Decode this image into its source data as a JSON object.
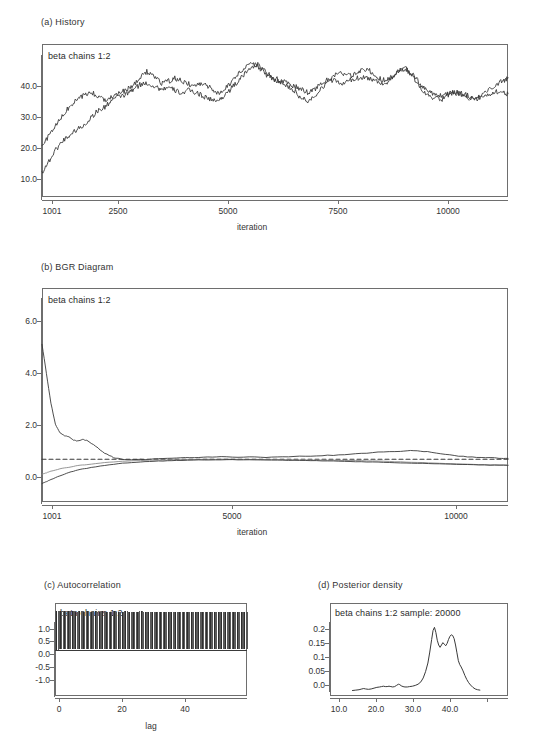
{
  "figure": {
    "background": "#ffffff",
    "line_color": "#3a3a3a",
    "frame_color": "#6e6e6e"
  },
  "panels": {
    "history": {
      "title": "(a)  History",
      "legend": "beta chains 1:2",
      "xlabel": "iteration",
      "yticks": [
        "10.0",
        "20.0",
        "30.0",
        "40.0"
      ],
      "xticks": [
        "1001",
        "2500",
        "5000",
        "7500",
        "10000"
      ]
    },
    "bgr": {
      "title": "(b)  BGR Diagram",
      "legend": "beta chains 1:2",
      "xlabel": "iteration",
      "yticks": [
        "0.0",
        "2.0",
        "4.0",
        "6.0"
      ],
      "xticks": [
        "1001",
        "5000",
        "10000"
      ]
    },
    "autocorrelation": {
      "title": "(c)  Autocorrelation",
      "legend": "beta chains 1:2",
      "xlabel": "lag",
      "yticks": [
        "-1.0",
        "-0.5",
        "0.0",
        "0.5",
        "1.0"
      ],
      "xticks": [
        "0",
        "20",
        "40"
      ]
    },
    "density": {
      "title": "(d)  Posterior density",
      "legend": "beta chains 1:2 sample: 20000",
      "xlabel": "",
      "yticks": [
        "0.0",
        "0.05",
        "0.1",
        "0.15",
        "0.2"
      ],
      "xticks": [
        "10.0",
        "20.0",
        "30.0",
        "40.0"
      ]
    }
  },
  "chart_data": [
    {
      "type": "line",
      "id": "history",
      "title": "(a)  History",
      "subtitle": "beta chains 1:2",
      "xlabel": "iteration",
      "ylabel": "",
      "xlim": [
        1001,
        11000
      ],
      "ylim": [
        8.0,
        44.0
      ],
      "xticks": [
        1001,
        2500,
        5000,
        7500,
        10000
      ],
      "yticks": [
        10.0,
        20.0,
        30.0,
        40.0
      ],
      "grid": false,
      "legend_position": "top-left-inside",
      "series": [
        {
          "name": "chain 1",
          "color": "#3a3a3a",
          "x": [
            1001,
            1150,
            1300,
            1450,
            1600,
            1750,
            1900,
            2050,
            2200,
            2350,
            2500,
            2650,
            2800,
            2950,
            3100,
            3250,
            3400,
            3550,
            3700,
            3850,
            4000,
            4150,
            4300,
            4450,
            4600,
            4750,
            4900,
            5050,
            5200,
            5350,
            5500,
            5650,
            5800,
            5950,
            6100,
            6250,
            6400,
            6550,
            6700,
            6850,
            7000,
            7150,
            7300,
            7450,
            7600,
            7750,
            7900,
            8050,
            8200,
            8350,
            8500,
            8650,
            8800,
            8950,
            9100,
            9250,
            9400,
            9550,
            9700,
            9850,
            10000,
            10150,
            10300,
            10450,
            10600,
            10750,
            10900,
            11000
          ],
          "y": [
            19.8,
            22.5,
            24.8,
            27.2,
            29.4,
            30.8,
            31.9,
            32.7,
            31.6,
            30.9,
            31.8,
            32.4,
            33.1,
            34.2,
            35.9,
            37.6,
            36.4,
            34.8,
            35.2,
            35.9,
            35.3,
            34.6,
            34.1,
            34.8,
            33.9,
            32.1,
            33.4,
            34.9,
            36.8,
            38.4,
            39.7,
            38.6,
            36.9,
            35.8,
            35.1,
            34.4,
            33.2,
            31.4,
            30.6,
            31.9,
            33.7,
            35.4,
            36.8,
            37.2,
            36.4,
            36.9,
            38.2,
            37.6,
            36.1,
            35.4,
            36.2,
            37.8,
            38.3,
            36.4,
            34.2,
            32.1,
            31.3,
            30.8,
            31.9,
            32.6,
            32.1,
            31.4,
            30.9,
            31.8,
            33.4,
            34.6,
            35.4,
            36.1
          ]
        },
        {
          "name": "chain 2",
          "color": "#3a3a3a",
          "x": [
            1001,
            1150,
            1300,
            1450,
            1600,
            1750,
            1900,
            2050,
            2200,
            2350,
            2500,
            2650,
            2800,
            2950,
            3100,
            3250,
            3400,
            3550,
            3700,
            3850,
            4000,
            4150,
            4300,
            4450,
            4600,
            4750,
            4900,
            5050,
            5200,
            5350,
            5500,
            5650,
            5800,
            5950,
            6100,
            6250,
            6400,
            6550,
            6700,
            6850,
            7000,
            7150,
            7300,
            7450,
            7600,
            7750,
            7900,
            8050,
            8200,
            8350,
            8500,
            8650,
            8800,
            8950,
            9100,
            9250,
            9400,
            9550,
            9700,
            9850,
            10000,
            10150,
            10300,
            10450,
            10600,
            10750,
            10900,
            11000
          ],
          "y": [
            13.8,
            16.4,
            19.2,
            21.3,
            22.6,
            23.9,
            24.8,
            26.7,
            28.3,
            29.1,
            30.9,
            31.6,
            32.1,
            33.2,
            34.4,
            34.8,
            34.1,
            33.4,
            33.7,
            33.1,
            32.4,
            33.1,
            32.6,
            31.8,
            31.1,
            30.4,
            31.8,
            33.4,
            35.1,
            36.9,
            38.8,
            39.1,
            37.4,
            36.2,
            35.4,
            34.8,
            34.1,
            33.4,
            32.6,
            33.4,
            34.6,
            35.8,
            35.2,
            34.6,
            35.4,
            35.9,
            36.3,
            35.8,
            35.2,
            34.6,
            35.8,
            37.4,
            38.1,
            36.8,
            34.8,
            33.1,
            32.4,
            31.8,
            32.4,
            32.8,
            32.4,
            31.8,
            31.2,
            31.6,
            32.2,
            32.9,
            32.4,
            32.3
          ]
        }
      ]
    },
    {
      "type": "line",
      "id": "bgr",
      "title": "(b)  BGR Diagram",
      "subtitle": "beta chains 1:2",
      "xlabel": "iteration",
      "ylabel": "",
      "xlim": [
        1001,
        11400
      ],
      "ylim": [
        -0.6,
        7.4
      ],
      "xticks": [
        1001,
        5000,
        10000
      ],
      "yticks": [
        0.0,
        2.0,
        4.0,
        6.0
      ],
      "grid": false,
      "reference_line": {
        "y": 1.0,
        "style": "dashed",
        "color": "#3a3a3a"
      },
      "legend_position": "top-left-inside",
      "series": [
        {
          "name": "R-hat",
          "color": "#3a3a3a",
          "x": [
            1001,
            1100,
            1200,
            1300,
            1400,
            1500,
            1600,
            1700,
            1800,
            1900,
            2000,
            2200,
            2400,
            2600,
            2800,
            3000,
            3400,
            3800,
            4200,
            4600,
            5000,
            5500,
            6000,
            6500,
            7000,
            7500,
            8000,
            8500,
            9000,
            9300,
            9600,
            10000,
            10400,
            10800,
            11200,
            11400
          ],
          "y": [
            5.3,
            4.2,
            3.1,
            2.3,
            1.98,
            1.88,
            1.85,
            1.72,
            1.68,
            1.74,
            1.7,
            1.48,
            1.22,
            1.06,
            0.99,
            0.97,
            1.0,
            1.03,
            1.06,
            1.07,
            1.09,
            1.08,
            1.07,
            1.09,
            1.12,
            1.15,
            1.2,
            1.26,
            1.3,
            1.32,
            1.28,
            1.18,
            1.1,
            1.06,
            1.04,
            1.03
          ]
        },
        {
          "name": "pooled",
          "color": "#8a8a8a",
          "x": [
            1001,
            1100,
            1200,
            1400,
            1600,
            1800,
            2000,
            2400,
            2800,
            3200,
            3600,
            4000,
            4500,
            5000,
            5500,
            6000,
            6500,
            7000,
            7500,
            8000,
            8500,
            9000,
            9500,
            10000,
            10500,
            11000,
            11400
          ],
          "y": [
            0.44,
            0.49,
            0.55,
            0.64,
            0.7,
            0.76,
            0.8,
            0.87,
            0.92,
            0.95,
            0.97,
            0.98,
            0.99,
            1.0,
            0.99,
            0.99,
            0.98,
            0.97,
            0.96,
            0.95,
            0.93,
            0.9,
            0.87,
            0.84,
            0.81,
            0.79,
            0.78
          ]
        },
        {
          "name": "within",
          "color": "#3a3a3a",
          "x": [
            1001,
            1100,
            1200,
            1400,
            1600,
            1800,
            2000,
            2400,
            2800,
            3200,
            3600,
            4000,
            4500,
            5000,
            5500,
            6000,
            6500,
            7000,
            7500,
            8000,
            8500,
            9000,
            9500,
            10000,
            10500,
            11000,
            11400
          ],
          "y": [
            0.09,
            0.16,
            0.24,
            0.38,
            0.5,
            0.6,
            0.66,
            0.77,
            0.85,
            0.9,
            0.93,
            0.95,
            0.97,
            0.98,
            0.98,
            0.97,
            0.96,
            0.95,
            0.93,
            0.91,
            0.89,
            0.86,
            0.84,
            0.82,
            0.8,
            0.78,
            0.77
          ]
        }
      ]
    },
    {
      "type": "bar",
      "id": "autocorrelation",
      "title": "(c)  Autocorrelation",
      "subtitle": "beta chains 1:2",
      "xlabel": "lag",
      "ylabel": "",
      "xlim": [
        0,
        50
      ],
      "ylim": [
        -1.2,
        1.2
      ],
      "xticks": [
        0,
        20,
        40
      ],
      "yticks": [
        -1.0,
        -0.5,
        0.0,
        0.5,
        1.0
      ],
      "grid": false,
      "note": "dense stems from lag 0 to 50 all near value 1.0 (very high autocorrelation)",
      "categories": [
        0,
        1,
        2,
        3,
        4,
        5,
        6,
        7,
        8,
        9,
        10,
        11,
        12,
        13,
        14,
        15,
        16,
        17,
        18,
        19,
        20,
        21,
        22,
        23,
        24,
        25,
        26,
        27,
        28,
        29,
        30,
        31,
        32,
        33,
        34,
        35,
        36,
        37,
        38,
        39,
        40,
        41,
        42,
        43,
        44,
        45,
        46,
        47,
        48,
        49,
        50
      ],
      "values": [
        1.0,
        0.99,
        0.99,
        0.99,
        0.99,
        0.98,
        0.99,
        0.98,
        0.99,
        0.98,
        0.99,
        0.98,
        0.99,
        0.98,
        0.98,
        0.99,
        0.98,
        0.98,
        0.99,
        0.98,
        0.98,
        0.98,
        0.99,
        0.98,
        0.98,
        0.98,
        0.98,
        0.98,
        0.98,
        0.98,
        0.97,
        0.98,
        0.98,
        0.97,
        0.98,
        0.97,
        0.98,
        0.97,
        0.97,
        0.97,
        0.97,
        0.97,
        0.97,
        0.96,
        0.97,
        0.96,
        0.97,
        0.96,
        0.96,
        0.96,
        0.96
      ]
    },
    {
      "type": "line",
      "id": "density",
      "title": "(d)  Posterior density",
      "subtitle": "beta chains 1:2 sample: 20000",
      "xlabel": "",
      "ylabel": "",
      "xlim": [
        8.0,
        46.0
      ],
      "ylim": [
        -0.012,
        0.225
      ],
      "xticks": [
        10.0,
        20.0,
        30.0,
        40.0
      ],
      "yticks": [
        0.0,
        0.05,
        0.1,
        0.15,
        0.2
      ],
      "grid": false,
      "legend_position": "top-left-inside",
      "series": [
        {
          "name": "beta posterior density",
          "color": "#3a3a3a",
          "x": [
            12.8,
            13.5,
            14.2,
            14.8,
            15.2,
            15.6,
            16.2,
            16.8,
            17.4,
            18.0,
            18.6,
            19.0,
            19.4,
            19.8,
            20.2,
            20.6,
            21.0,
            21.4,
            21.8,
            22.2,
            22.6,
            22.9,
            23.2,
            23.6,
            24.0,
            24.5,
            25.0,
            25.6,
            26.2,
            26.8,
            27.4,
            27.9,
            28.4,
            28.9,
            29.3,
            29.7,
            30.0,
            30.3,
            30.6,
            30.9,
            31.2,
            31.5,
            31.8,
            32.1,
            32.4,
            32.7,
            33.0,
            33.3,
            33.6,
            33.9,
            34.2,
            34.5,
            34.8,
            35.1,
            35.4,
            35.7,
            36.0,
            36.4,
            36.8,
            37.2,
            37.6,
            38.0,
            38.5,
            39.0,
            39.5,
            40.0
          ],
          "y": [
            0.002,
            0.003,
            0.004,
            0.006,
            0.007,
            0.006,
            0.005,
            0.006,
            0.008,
            0.01,
            0.011,
            0.012,
            0.013,
            0.012,
            0.012,
            0.013,
            0.012,
            0.011,
            0.012,
            0.015,
            0.018,
            0.017,
            0.014,
            0.012,
            0.011,
            0.011,
            0.012,
            0.013,
            0.015,
            0.018,
            0.024,
            0.034,
            0.05,
            0.072,
            0.1,
            0.132,
            0.155,
            0.163,
            0.15,
            0.13,
            0.118,
            0.112,
            0.118,
            0.124,
            0.12,
            0.116,
            0.122,
            0.132,
            0.14,
            0.144,
            0.142,
            0.134,
            0.118,
            0.098,
            0.078,
            0.068,
            0.062,
            0.052,
            0.04,
            0.03,
            0.022,
            0.016,
            0.01,
            0.006,
            0.004,
            0.003
          ]
        }
      ]
    }
  ]
}
